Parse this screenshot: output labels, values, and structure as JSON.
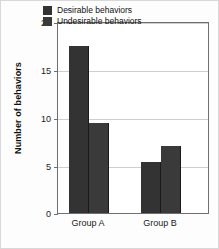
{
  "chart_data": {
    "type": "bar",
    "title": "",
    "xlabel": "",
    "ylabel": "Number of behaviors",
    "categories": [
      "Group A",
      "Group B"
    ],
    "series": [
      {
        "name": "Desirable behaviors",
        "values": [
          17.4,
          5.3
        ],
        "color": "#333333"
      },
      {
        "name": "Undesirable behaviors",
        "values": [
          9.4,
          7.0
        ],
        "color": "#3a3a3a"
      }
    ],
    "ylim": [
      0,
      20
    ],
    "yticks": [
      0,
      5,
      10,
      15,
      20
    ],
    "ytick_labels": [
      "0",
      "5",
      "10",
      "15",
      "20"
    ],
    "grid": "horizontal",
    "legend_position": "top-right-inside"
  },
  "axes": {
    "y_title": "Number of behaviors",
    "y_labels": {
      "t0": "0",
      "t5": "5",
      "t10": "10",
      "t15": "15",
      "t20": "20"
    },
    "x_labels": {
      "g1": "Group A",
      "g2": "Group B"
    }
  },
  "legend": {
    "items": [
      {
        "label": "Desirable behaviors"
      },
      {
        "label": "Undesirable behaviors"
      }
    ]
  }
}
